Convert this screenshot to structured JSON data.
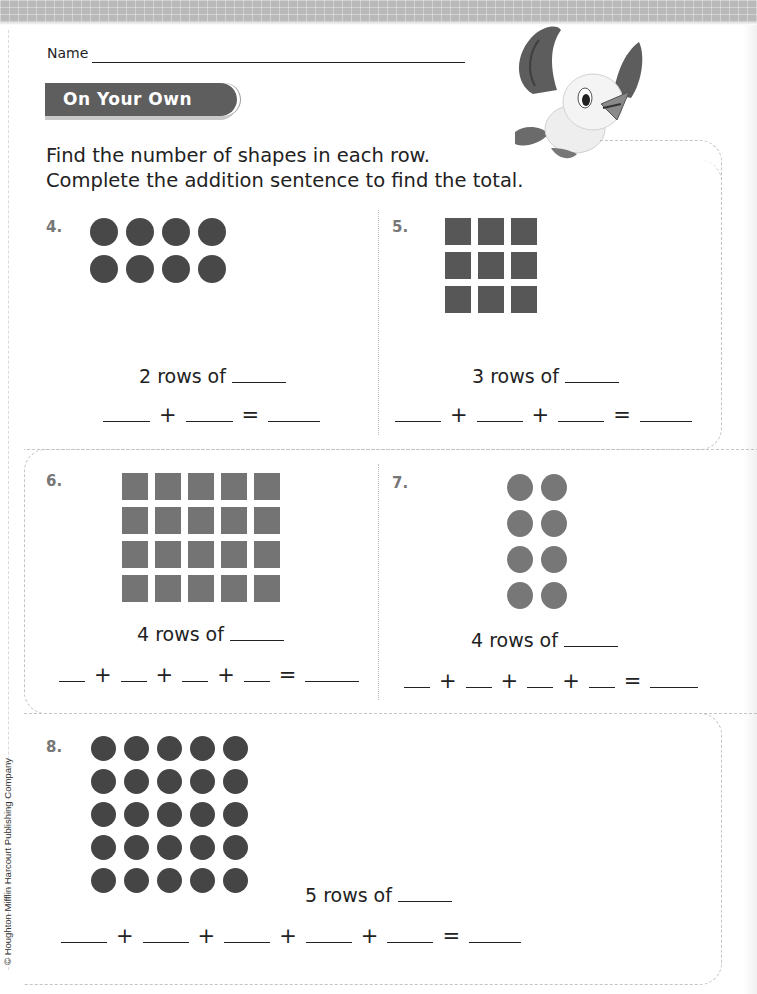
{
  "header": {
    "name_label": "Name",
    "section_title": "On Your Own"
  },
  "instructions": {
    "line1": "Find the number of shapes in each row.",
    "line2": "Complete the addition sentence to find the total."
  },
  "colors": {
    "ribbon": "#5e5e5e",
    "shape_dark": "#484848",
    "shape_medium": "#5a5a5a",
    "shape_light": "#747474",
    "dashed_border": "#c4c4c4",
    "question_number": "#777777"
  },
  "problems": [
    {
      "number": "4.",
      "shape": "circle",
      "rows": 2,
      "columns": 4,
      "rows_prompt": "2 rows of",
      "addends": 2,
      "plus": "+",
      "equals": "="
    },
    {
      "number": "5.",
      "shape": "square",
      "rows": 3,
      "columns": 3,
      "rows_prompt": "3 rows of",
      "addends": 3,
      "plus": "+",
      "equals": "="
    },
    {
      "number": "6.",
      "shape": "square",
      "rows": 4,
      "columns": 5,
      "rows_prompt": "4 rows of",
      "addends": 4,
      "plus": "+",
      "equals": "="
    },
    {
      "number": "7.",
      "shape": "circle",
      "rows": 4,
      "columns": 2,
      "rows_prompt": "4 rows of",
      "addends": 4,
      "plus": "+",
      "equals": "="
    },
    {
      "number": "8.",
      "shape": "circle",
      "rows": 5,
      "columns": 5,
      "rows_prompt": "5 rows of",
      "addends": 5,
      "plus": "+",
      "equals": "="
    }
  ],
  "mascot": "bird-mascot",
  "footer": {
    "copyright": "© Houghton Mifflin Harcourt Publishing Company"
  }
}
